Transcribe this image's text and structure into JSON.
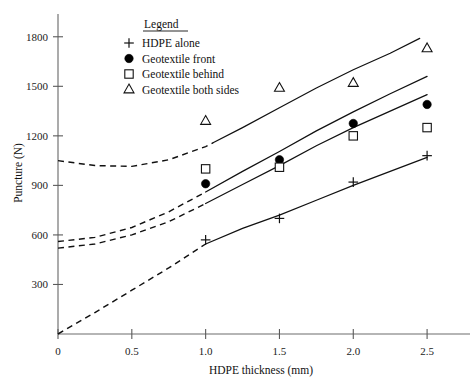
{
  "chart_data": {
    "type": "scatter",
    "title": "",
    "xlabel": "HDPE thickness (mm)",
    "ylabel": "Puncture (N)",
    "xlim": [
      0,
      2.75
    ],
    "ylim": [
      0,
      1950
    ],
    "xticks": [
      0,
      0.5,
      1.0,
      1.5,
      2.0,
      2.5
    ],
    "xticklabels": [
      "0",
      "0.5",
      "1.0",
      "1.5",
      "2.0",
      "2.5"
    ],
    "yticks": [
      300,
      600,
      900,
      1200,
      1500,
      1800
    ],
    "yticklabels": [
      "300",
      "600",
      "900",
      "1200",
      "1500",
      "1800"
    ],
    "grid": false,
    "legend_position": "upper-left-inside",
    "legend_title": "Legend",
    "x": [
      1.0,
      1.5,
      2.0,
      2.5
    ],
    "series": [
      {
        "name": "HDPE alone",
        "marker": "plus",
        "values": [
          570,
          700,
          920,
          1080
        ],
        "curve_dashed_from_x": 0.0,
        "curve_dashed_to_x": 1.0,
        "curve_points": [
          [
            0,
            0
          ],
          [
            0.25,
            130
          ],
          [
            0.5,
            265
          ],
          [
            0.75,
            400
          ],
          [
            1.0,
            545
          ],
          [
            1.25,
            640
          ],
          [
            1.5,
            720
          ],
          [
            1.75,
            810
          ],
          [
            2.0,
            900
          ],
          [
            2.25,
            985
          ],
          [
            2.5,
            1070
          ]
        ]
      },
      {
        "name": "Geotextile front",
        "marker": "filled-circle",
        "values": [
          910,
          1055,
          1275,
          1390
        ],
        "curve_dashed_from_x": 0.0,
        "curve_dashed_to_x": 1.0,
        "curve_points": [
          [
            0,
            520
          ],
          [
            0.25,
            545
          ],
          [
            0.5,
            600
          ],
          [
            0.75,
            680
          ],
          [
            1.0,
            790
          ],
          [
            1.25,
            905
          ],
          [
            1.5,
            1020
          ],
          [
            1.75,
            1140
          ],
          [
            2.0,
            1250
          ],
          [
            2.25,
            1350
          ],
          [
            2.5,
            1450
          ]
        ]
      },
      {
        "name": "Geotextile behind",
        "marker": "open-square",
        "values": [
          1000,
          1010,
          1200,
          1250
        ],
        "curve_dashed_from_x": 0.0,
        "curve_dashed_to_x": 1.0,
        "curve_points": [
          [
            0,
            560
          ],
          [
            0.25,
            585
          ],
          [
            0.5,
            645
          ],
          [
            0.75,
            740
          ],
          [
            1.0,
            860
          ],
          [
            1.25,
            985
          ],
          [
            1.5,
            1105
          ],
          [
            1.75,
            1230
          ],
          [
            2.0,
            1345
          ],
          [
            2.25,
            1455
          ],
          [
            2.5,
            1560
          ]
        ]
      },
      {
        "name": "Geotextile both sides",
        "marker": "open-triangle",
        "values": [
          1290,
          1490,
          1520,
          1730
        ],
        "curve_dashed_from_x": 0.0,
        "curve_dashed_to_x": 1.05,
        "curve_points": [
          [
            0,
            1050
          ],
          [
            0.25,
            1020
          ],
          [
            0.5,
            1015
          ],
          [
            0.75,
            1055
          ],
          [
            1.0,
            1135
          ],
          [
            1.25,
            1250
          ],
          [
            1.5,
            1370
          ],
          [
            1.75,
            1490
          ],
          [
            2.0,
            1600
          ],
          [
            2.25,
            1700
          ],
          [
            2.45,
            1790
          ]
        ]
      }
    ],
    "legend_entries": [
      {
        "marker": "plus",
        "label": "HDPE alone"
      },
      {
        "marker": "filled-circle",
        "label": "Geotextile front"
      },
      {
        "marker": "open-square",
        "label": "Geotextile behind"
      },
      {
        "marker": "open-triangle",
        "label": "Geotextile both sides"
      }
    ],
    "colors": {
      "background": "#ffffff",
      "ink": "#111111",
      "axis": "#6d6d6d"
    }
  }
}
